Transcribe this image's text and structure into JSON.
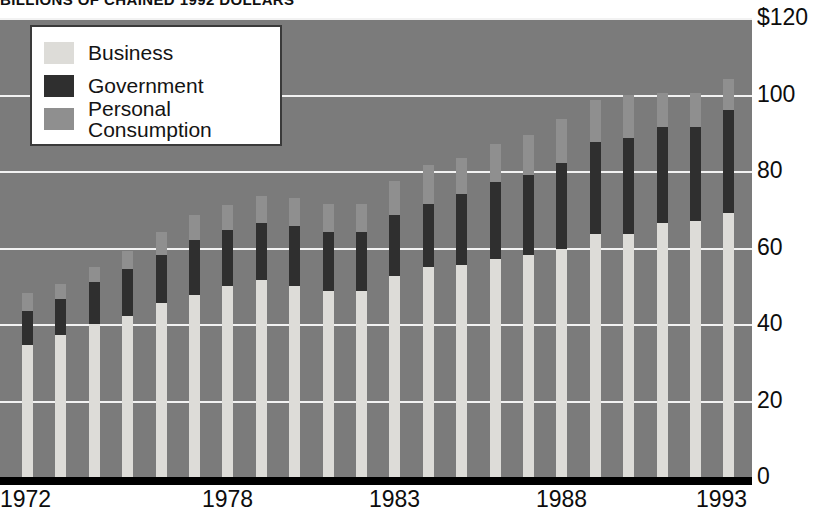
{
  "chart_title": "BILLIONS OF CHAINED 1992 DOLLARS",
  "legend": {
    "items": [
      {
        "label": "Business",
        "color": "#dddcd8",
        "key": "business"
      },
      {
        "label": "Government",
        "color": "#2f2f2f",
        "key": "government"
      },
      {
        "label": "Personal Consumption",
        "color": "#8f8f8f",
        "key": "personal"
      }
    ]
  },
  "axis": {
    "y_ticks": [
      "$120",
      "100",
      "80",
      "60",
      "40",
      "20",
      "0"
    ],
    "y_tick_values": [
      120,
      100,
      80,
      60,
      40,
      20,
      0
    ],
    "x_ticks": [
      "1972",
      "1978",
      "1983",
      "1988",
      "1993"
    ]
  },
  "colors": {
    "plot_background": "#7b7b7b",
    "gridline": "#f2f2f2",
    "baseline": "#000000",
    "business": "#dddcd8",
    "government": "#2f2f2f",
    "personal_consumption": "#8f8f8f"
  },
  "chart_data": {
    "type": "bar",
    "title": "BILLIONS OF CHAINED 1992 DOLLARS",
    "xlabel": "",
    "ylabel": "",
    "ylim": [
      0,
      120
    ],
    "grid": true,
    "stacked": true,
    "legend_position": "top-left",
    "categories": [
      "1972",
      "1973",
      "1974",
      "1975",
      "1976",
      "1977",
      "1978",
      "1979",
      "1980",
      "1981",
      "1982",
      "1983",
      "1984",
      "1985",
      "1986",
      "1987",
      "1988",
      "1989",
      "1990",
      "1991",
      "1992",
      "1993"
    ],
    "series": [
      {
        "name": "Business",
        "values": [
          34.5,
          37.0,
          40.0,
          42.0,
          45.5,
          47.5,
          50.0,
          51.5,
          50.0,
          48.5,
          48.5,
          52.5,
          55.0,
          55.5,
          57.0,
          58.0,
          59.5,
          63.5,
          63.5,
          66.5,
          67.0,
          69.0
        ]
      },
      {
        "name": "Government",
        "values": [
          9.0,
          9.5,
          11.0,
          12.5,
          12.5,
          14.5,
          14.5,
          15.0,
          15.5,
          15.5,
          15.5,
          16.0,
          16.5,
          18.5,
          20.0,
          21.0,
          22.5,
          24.0,
          25.0,
          25.0,
          24.5,
          27.0
        ]
      },
      {
        "name": "Personal Consumption",
        "values": [
          4.5,
          4.0,
          4.0,
          4.5,
          6.0,
          6.5,
          6.5,
          7.0,
          7.5,
          7.5,
          7.5,
          9.0,
          10.0,
          9.5,
          10.0,
          10.5,
          11.5,
          11.0,
          11.5,
          9.0,
          9.0,
          8.0
        ]
      }
    ],
    "totals": [
      48,
      50.5,
      55,
      59,
      64,
      68.5,
      71,
      73.5,
      73,
      71.5,
      71.5,
      77.5,
      81.5,
      83.5,
      87,
      89.5,
      93.5,
      98.5,
      100,
      100.5,
      100.5,
      104
    ]
  }
}
